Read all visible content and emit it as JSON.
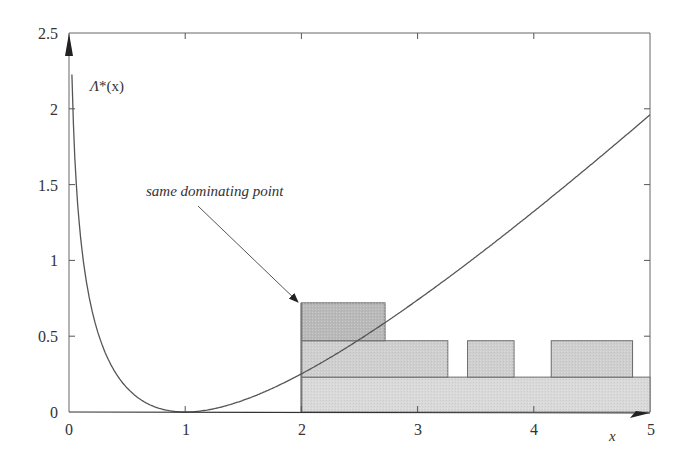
{
  "chart_data": {
    "type": "line",
    "title": "",
    "xlabel": "x",
    "ylabel": "Λ*(x)",
    "xlim": [
      0,
      5
    ],
    "ylim": [
      0,
      2.5
    ],
    "xticks": [
      "0",
      "1",
      "2",
      "3",
      "4",
      "5"
    ],
    "yticks": [
      "0",
      "0.5",
      "1",
      "1.5",
      "2",
      "2.5"
    ],
    "grid": false,
    "legend": null,
    "series": [
      {
        "name": "Λ*(x)",
        "kind": "curve",
        "description": "rate function with minimum 0 at x=1, rising steeply near 0 and increasing toward ~2.37 at x=5",
        "x": [
          0.02,
          0.05,
          0.1,
          0.2,
          0.3,
          0.4,
          0.5,
          0.6,
          0.7,
          0.8,
          0.9,
          1.0,
          1.2,
          1.5,
          2.0,
          2.5,
          3.0,
          3.5,
          4.0,
          4.5,
          5.0
        ],
        "y": [
          2.5,
          1.9,
          1.4,
          0.86,
          0.56,
          0.37,
          0.23,
          0.13,
          0.07,
          0.03,
          0.005,
          0.0,
          0.02,
          0.1,
          0.3,
          0.55,
          0.84,
          1.18,
          1.55,
          1.95,
          2.37
        ]
      }
    ],
    "rectangles": [
      {
        "x0": 2.0,
        "x1": 2.72,
        "y0": 0.47,
        "y1": 0.72,
        "shade": "dark"
      },
      {
        "x0": 2.0,
        "x1": 3.26,
        "y0": 0.23,
        "y1": 0.47,
        "shade": "light"
      },
      {
        "x0": 3.43,
        "x1": 3.83,
        "y0": 0.23,
        "y1": 0.47,
        "shade": "light"
      },
      {
        "x0": 4.15,
        "x1": 4.85,
        "y0": 0.23,
        "y1": 0.47,
        "shade": "light"
      },
      {
        "x0": 2.0,
        "x1": 5.0,
        "y0": 0.0,
        "y1": 0.23,
        "shade": "lighter"
      }
    ],
    "annotations": [
      {
        "text": "same dominating point",
        "arrow_to": [
          2.0,
          0.72
        ]
      }
    ]
  },
  "labels": {
    "y_axis_label_main": "Λ",
    "y_axis_label_rest": "*(x)",
    "x_axis_label": "x",
    "annotation": "same dominating point",
    "xticks": [
      "0",
      "1",
      "2",
      "3",
      "4",
      "5"
    ],
    "yticks": [
      "0",
      "0.5",
      "1",
      "1.5",
      "2",
      "2.5"
    ]
  },
  "colors": {
    "axis": "#555555",
    "curve": "#555555",
    "rect_dark": "#b9b9b9",
    "rect_light": "#cfcfcf",
    "rect_lighter": "#d9d9d9",
    "rect_stroke": "#6a6a6a"
  }
}
